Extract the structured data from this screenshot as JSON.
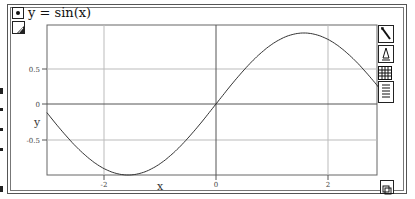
{
  "window": {
    "title": "y = sin(x)",
    "function_selected": true
  },
  "toolbar": {
    "tools": [
      {
        "name": "pen-tool-icon"
      },
      {
        "name": "shape-tool-icon"
      },
      {
        "name": "grid-table-icon"
      },
      {
        "name": "document-list-icon"
      }
    ],
    "resize_icon": "resize-corner-icon"
  },
  "colors": {
    "curve": "#333333",
    "axis": "#555555",
    "grid": "#bbbbbb",
    "frame": "#555555"
  },
  "chart_data": {
    "type": "line",
    "title": "y = sin(x)",
    "xlabel": "x",
    "ylabel": "y",
    "xlim": [
      -3.02,
      3.02
    ],
    "ylim": [
      -1.0,
      1.0
    ],
    "x_ticks": [
      -2,
      0,
      2
    ],
    "x_tick_labels": [
      "-2",
      "0",
      "2"
    ],
    "y_ticks": [
      -0.5,
      0,
      0.5
    ],
    "y_tick_labels": [
      "-0.5",
      "0",
      "0.5"
    ],
    "grid": true,
    "legend": null,
    "series": [
      {
        "name": "sin(x)",
        "x": [
          -3.0,
          -2.5,
          -2.0,
          -1.5708,
          -1.0,
          -0.5,
          0.0,
          0.5,
          1.0,
          1.5708,
          2.0,
          2.5,
          3.0
        ],
        "y": [
          -0.141,
          -0.598,
          -0.909,
          -1.0,
          -0.841,
          -0.479,
          0.0,
          0.479,
          0.841,
          1.0,
          0.909,
          0.598,
          0.141
        ]
      }
    ]
  },
  "labels": {
    "x_axis": "x",
    "y_axis": "y",
    "xt_m2": "-2",
    "xt_0": "0",
    "xt_2": "2",
    "yt_p05": "0.5",
    "yt_0": "0",
    "yt_m05": "-0.5"
  }
}
